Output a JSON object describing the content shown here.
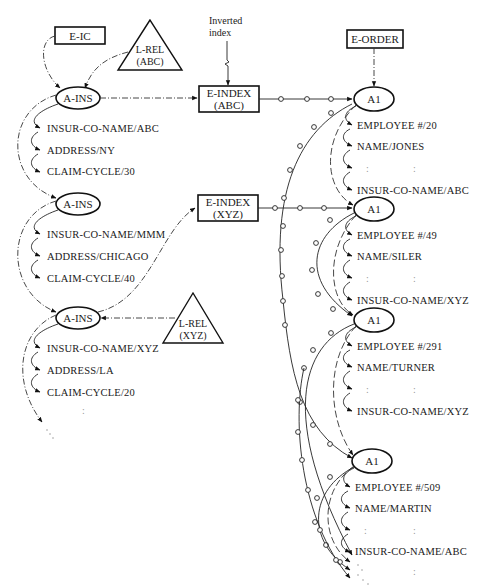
{
  "diagram": {
    "annotation": {
      "line1": "Inverted",
      "line2": "index"
    },
    "entities": {
      "e_ic": "E-IC",
      "e_order": "E-ORDER",
      "e_index_abc": {
        "line1": "E-INDEX",
        "line2": "(ABC)"
      },
      "e_index_xyz": {
        "line1": "E-INDEX",
        "line2": "(XYZ)"
      }
    },
    "links": {
      "l_rel_abc": {
        "line1": "L-REL",
        "line2": "(ABC)"
      },
      "l_rel_xyz": {
        "line1": "L-REL",
        "line2": "(XYZ)"
      }
    },
    "insurance_records": [
      {
        "node": "A-INS",
        "fields": [
          "INSUR-CO-NAME/ABC",
          "ADDRESS/NY",
          "CLAIM-CYCLE/30"
        ]
      },
      {
        "node": "A-INS",
        "fields": [
          "INSUR-CO-NAME/MMM",
          "ADDRESS/CHICAGO",
          "CLAIM-CYCLE/40"
        ]
      },
      {
        "node": "A-INS",
        "fields": [
          "INSUR-CO-NAME/XYZ",
          "ADDRESS/LA",
          "CLAIM-CYCLE/20"
        ]
      }
    ],
    "employee_records": [
      {
        "node": "A1",
        "fields": [
          "EMPLOYEE #/20",
          "NAME/JONES",
          "INSUR-CO-NAME/ABC"
        ]
      },
      {
        "node": "A1",
        "fields": [
          "EMPLOYEE #/49",
          "NAME/SILER",
          "INSUR-CO-NAME/XYZ"
        ]
      },
      {
        "node": "A1",
        "fields": [
          "EMPLOYEE #/291",
          "NAME/TURNER",
          "INSUR-CO-NAME/XYZ"
        ]
      },
      {
        "node": "A1",
        "fields": [
          "EMPLOYEE #/509",
          "NAME/MARTIN",
          "INSUR-CO-NAME/ABC"
        ]
      }
    ],
    "ellipsis": ":"
  }
}
